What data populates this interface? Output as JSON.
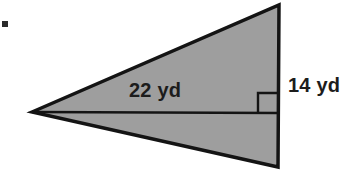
{
  "figure": {
    "kind": "triangle-with-height",
    "bullet": {
      "name": "item-bullet",
      "x": 2,
      "y": 21,
      "size": 6,
      "color": "#2b2b2b"
    },
    "colors": {
      "fill": "#9e9e9e",
      "stroke": "#141414",
      "background": "#ffffff",
      "text": "#1c1c1c"
    },
    "triangle": {
      "name": "shaded-triangle",
      "points": "32,112 279,5 278,167",
      "vertices": [
        {
          "label": "left-apex",
          "x": 32,
          "y": 112
        },
        {
          "label": "top-right",
          "x": 279,
          "y": 5
        },
        {
          "label": "bottom-right",
          "x": 278,
          "y": 167
        }
      ],
      "stroke_width": 3.5
    },
    "height_line": {
      "name": "height-segment",
      "x1": 32,
      "y1": 112,
      "x2": 278.5,
      "y2": 113,
      "stroke_width": 2.6
    },
    "right_angle_marker": {
      "name": "right-angle-marker",
      "points": "258,113 258,93 278,93",
      "stroke_width": 2.4
    },
    "labels": [
      {
        "name": "base-length-label",
        "text": "22 yd",
        "x": 129,
        "y": 97,
        "anchor": "start"
      },
      {
        "name": "height-length-label",
        "text": "14 yd",
        "x": 288,
        "y": 92,
        "anchor": "start"
      }
    ]
  }
}
